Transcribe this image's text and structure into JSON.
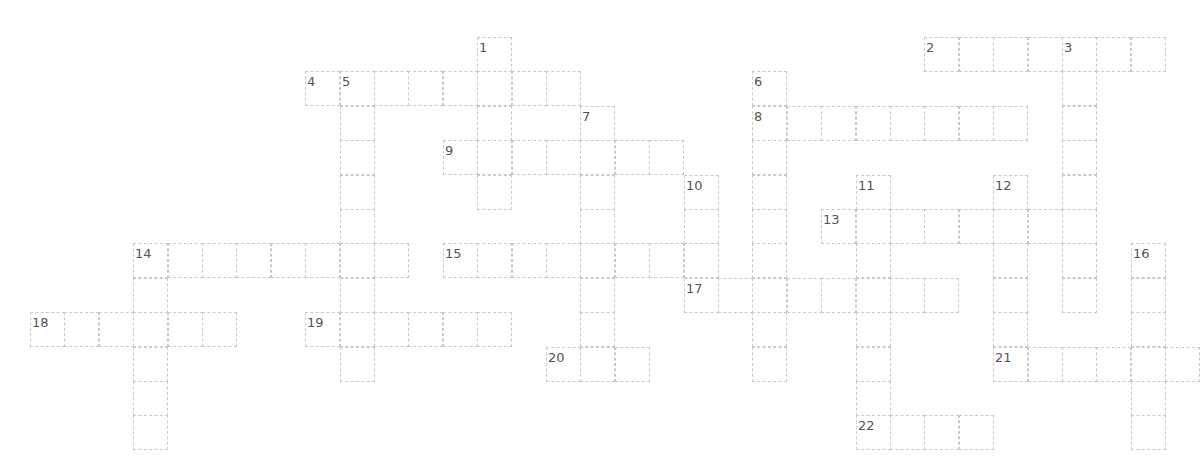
{
  "puzzle": {
    "type": "crossword",
    "cell_size_px": 34.4,
    "origin_px": [
      30,
      37
    ],
    "columns": 34,
    "rows": 12,
    "border_color": "#c9c9c9",
    "number_color": "#555555",
    "words": [
      {
        "num": "1",
        "dir": "down",
        "col": 13,
        "row": 0,
        "len": 5
      },
      {
        "num": "2",
        "dir": "across",
        "col": 26,
        "row": 0,
        "len": 7
      },
      {
        "num": "3",
        "dir": "down",
        "col": 30,
        "row": 0,
        "len": 8
      },
      {
        "num": "4",
        "dir": "across",
        "col": 8,
        "row": 1,
        "len": 8
      },
      {
        "num": "5",
        "dir": "down",
        "col": 9,
        "row": 1,
        "len": 9
      },
      {
        "num": "6",
        "dir": "down",
        "col": 21,
        "row": 1,
        "len": 9
      },
      {
        "num": "7",
        "dir": "down",
        "col": 16,
        "row": 2,
        "len": 8
      },
      {
        "num": "8",
        "dir": "across",
        "col": 21,
        "row": 2,
        "len": 8
      },
      {
        "num": "9",
        "dir": "across",
        "col": 12,
        "row": 3,
        "len": 7
      },
      {
        "num": "10",
        "dir": "down",
        "col": 19,
        "row": 4,
        "len": 4
      },
      {
        "num": "11",
        "dir": "down",
        "col": 24,
        "row": 4,
        "len": 8
      },
      {
        "num": "12",
        "dir": "down",
        "col": 28,
        "row": 4,
        "len": 6
      },
      {
        "num": "13",
        "dir": "across",
        "col": 23,
        "row": 5,
        "len": 8
      },
      {
        "num": "14",
        "dir": "across",
        "col": 3,
        "row": 6,
        "len": 8
      },
      {
        "num": "14",
        "dir": "down",
        "col": 3,
        "row": 6,
        "len": 6
      },
      {
        "num": "15",
        "dir": "across",
        "col": 12,
        "row": 6,
        "len": 8
      },
      {
        "num": "16",
        "dir": "down",
        "col": 32,
        "row": 6,
        "len": 6
      },
      {
        "num": "17",
        "dir": "across",
        "col": 19,
        "row": 7,
        "len": 8
      },
      {
        "num": "18",
        "dir": "across",
        "col": 0,
        "row": 8,
        "len": 6
      },
      {
        "num": "19",
        "dir": "across",
        "col": 8,
        "row": 8,
        "len": 6
      },
      {
        "num": "20",
        "dir": "across",
        "col": 15,
        "row": 9,
        "len": 3
      },
      {
        "num": "21",
        "dir": "across",
        "col": 28,
        "row": 9,
        "len": 6
      },
      {
        "num": "22",
        "dir": "across",
        "col": 24,
        "row": 11,
        "len": 4
      }
    ]
  }
}
